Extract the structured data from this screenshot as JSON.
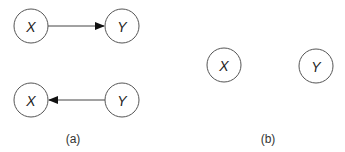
{
  "diagram": {
    "panels": [
      {
        "caption": "(a)",
        "graphs": [
          {
            "nodes": [
              {
                "id": "X",
                "label": "X"
              },
              {
                "id": "Y",
                "label": "Y"
              }
            ],
            "edges": [
              {
                "from": "X",
                "to": "Y",
                "directed": true
              }
            ]
          },
          {
            "nodes": [
              {
                "id": "X",
                "label": "X"
              },
              {
                "id": "Y",
                "label": "Y"
              }
            ],
            "edges": [
              {
                "from": "Y",
                "to": "X",
                "directed": true
              }
            ]
          }
        ]
      },
      {
        "caption": "(b)",
        "graphs": [
          {
            "nodes": [
              {
                "id": "X",
                "label": "X"
              },
              {
                "id": "Y",
                "label": "Y"
              }
            ],
            "edges": []
          }
        ]
      }
    ]
  },
  "colors": {
    "node_stroke": "#555555",
    "edge": "#444444",
    "text": "#222222"
  }
}
